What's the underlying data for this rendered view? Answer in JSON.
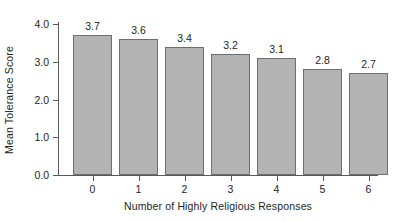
{
  "chart_data": {
    "type": "bar",
    "title": "",
    "subtitle": "",
    "xlabel": "Number of Highly Religious Responses",
    "ylabel": "Mean Tolerance Score",
    "categories": [
      "0",
      "1",
      "2",
      "3",
      "4",
      "5",
      "6"
    ],
    "values": [
      3.7,
      3.6,
      3.4,
      3.2,
      3.1,
      2.8,
      2.7
    ],
    "bar_labels": [
      "3.7",
      "3.6",
      "3.4",
      "3.2",
      "3.1",
      "2.8",
      "2.7"
    ],
    "ylim": [
      0.0,
      4.0
    ],
    "ytick_labels": [
      "0.0",
      "1.0",
      "2.0",
      "3.0",
      "4.0"
    ],
    "ytick_values": [
      0.0,
      1.0,
      2.0,
      3.0,
      4.0
    ],
    "grid": false,
    "legend": "none",
    "colors": {
      "bar_fill": "#b3b3b3",
      "bar_border": "#6d6e71",
      "axis": "#58595b",
      "text": "#231f20",
      "background": "#ffffff"
    }
  }
}
